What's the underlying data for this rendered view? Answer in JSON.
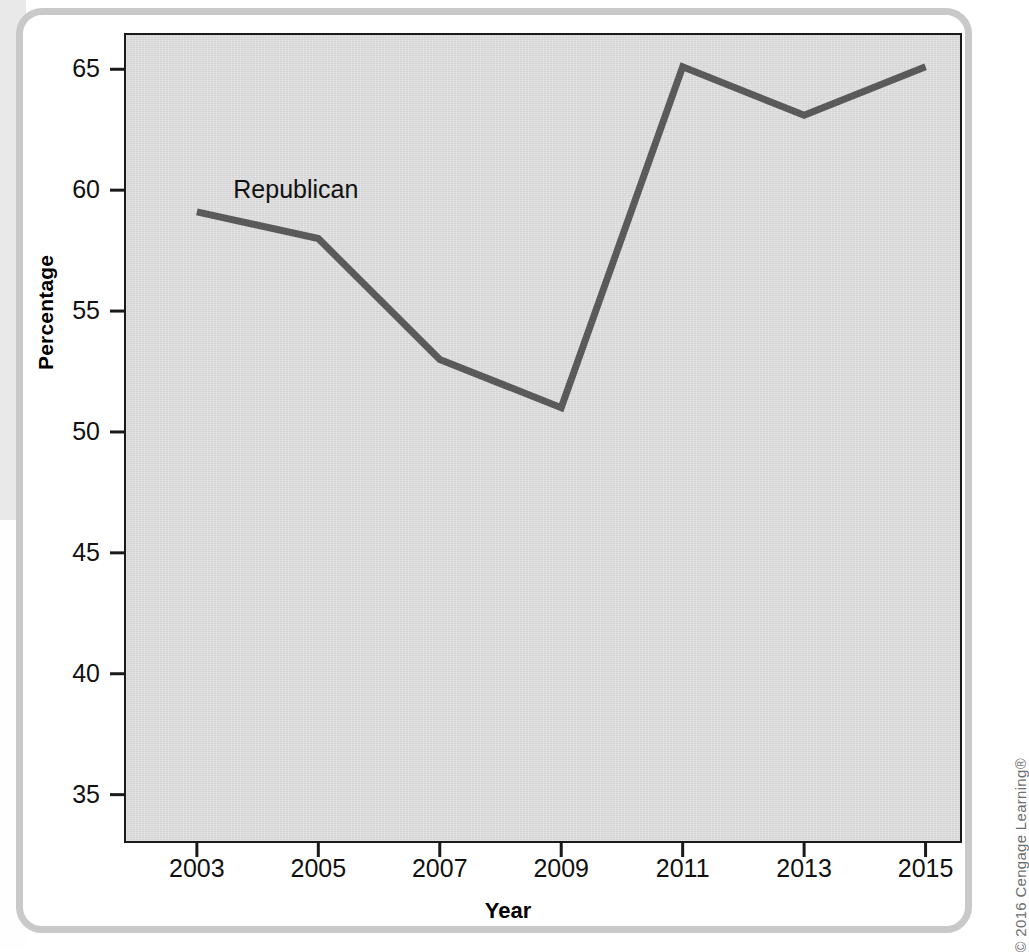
{
  "figure": {
    "copyright": "© 2016 Cengage Learning®",
    "frame_color": "#c9c9c9",
    "plot_background": "#d9d9d9",
    "axis_color": "#1a1a1a",
    "series_color": "#5a5a5a"
  },
  "chart_data": {
    "type": "line",
    "title": "",
    "xlabel": "Year",
    "ylabel": "Percentage",
    "categories": [
      "2003",
      "2005",
      "2007",
      "2009",
      "2011",
      "2013",
      "2015"
    ],
    "x": [
      2003,
      2005,
      2007,
      2009,
      2011,
      2013,
      2015
    ],
    "series": [
      {
        "name": "Republican",
        "color": "#5a5a5a",
        "values": [
          59.1,
          58.0,
          53.0,
          51.0,
          65.1,
          63.1,
          65.1
        ]
      }
    ],
    "annotations": [
      {
        "text": "Republican",
        "x": 2003.6,
        "y": 60.0
      }
    ],
    "ylim": [
      33,
      66.5
    ],
    "xlim": [
      2001.8,
      2015.6
    ],
    "yticks": [
      35,
      40,
      45,
      50,
      55,
      60,
      65
    ],
    "ytick_labels": [
      "35",
      "40",
      "45",
      "50",
      "55",
      "60",
      "65"
    ],
    "xticks": [
      2003,
      2005,
      2007,
      2009,
      2011,
      2013,
      2015
    ],
    "xtick_labels": [
      "2003",
      "2005",
      "2007",
      "2009",
      "2011",
      "2013",
      "2015"
    ],
    "grid": false,
    "legend": "inline-label"
  }
}
